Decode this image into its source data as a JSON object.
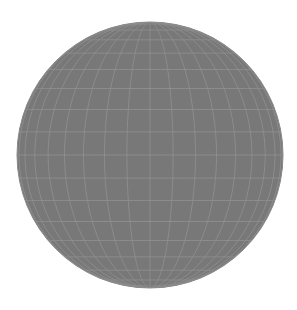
{
  "figure": {
    "title": "Orthographic wireframe globe",
    "kind": "graticule-sphere",
    "canvas": {
      "width": 297,
      "height": 310
    },
    "background_color": "#ffffff"
  },
  "globe": {
    "center_x": 150,
    "center_y": 155,
    "radius": 133,
    "fill_color": "#787878",
    "grid_color": "#919191",
    "rim_color": "#8a8a8a",
    "grid_line_width": 0.9,
    "rim_line_width": 1.0,
    "grid_opacity": 0.95,
    "graticule_step_degrees": 10,
    "meridian_count": 36,
    "parallel_count": 17,
    "latitude_range": [
      -90,
      90
    ],
    "longitude_range": [
      -180,
      180
    ],
    "view_rotation_longitude": 0,
    "view_rotation_latitude": 0,
    "projection": "orthographic",
    "samples_per_arc": 180
  },
  "labels": {
    "figure_caption": "Orthographic wireframe globe",
    "fill_swatch": "#787878",
    "grid_swatch": "#919191"
  }
}
